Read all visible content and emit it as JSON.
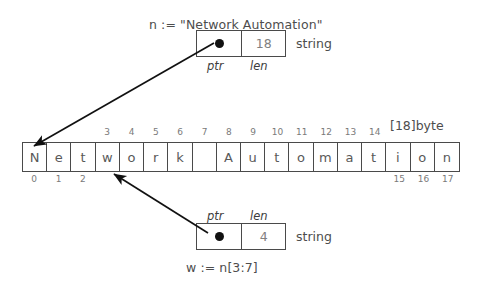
{
  "diagram": {
    "title_caption": "n := \"Network Automation\"",
    "bottom_caption": "w := n[3:7]",
    "array_type_label": "[18]byte",
    "field_ptr_label": "ptr",
    "field_len_label": "len",
    "string_type_label": "string"
  },
  "string_header_n": {
    "ptr_label": "ptr",
    "len_label": "len",
    "len_value": "18",
    "type_label": "string",
    "points_to_index": 0
  },
  "string_header_w": {
    "ptr_label": "ptr",
    "len_label": "len",
    "len_value": "4",
    "type_label": "string",
    "points_to_index": 3
  },
  "byte_array": {
    "type_label": "[18]byte",
    "length": 18,
    "cells": [
      {
        "index": "0",
        "char": "N",
        "index_side": "below"
      },
      {
        "index": "1",
        "char": "e",
        "index_side": "below"
      },
      {
        "index": "2",
        "char": "t",
        "index_side": "below"
      },
      {
        "index": "3",
        "char": "w",
        "index_side": "above"
      },
      {
        "index": "4",
        "char": "o",
        "index_side": "above"
      },
      {
        "index": "5",
        "char": "r",
        "index_side": "above"
      },
      {
        "index": "6",
        "char": "k",
        "index_side": "above"
      },
      {
        "index": "7",
        "char": " ",
        "index_side": "above"
      },
      {
        "index": "8",
        "char": "A",
        "index_side": "above"
      },
      {
        "index": "9",
        "char": "u",
        "index_side": "above"
      },
      {
        "index": "10",
        "char": "t",
        "index_side": "above"
      },
      {
        "index": "11",
        "char": "o",
        "index_side": "above"
      },
      {
        "index": "12",
        "char": "m",
        "index_side": "above"
      },
      {
        "index": "13",
        "char": "a",
        "index_side": "above"
      },
      {
        "index": "14",
        "char": "t",
        "index_side": "above"
      },
      {
        "index": "15",
        "char": "i",
        "index_side": "below"
      },
      {
        "index": "16",
        "char": "o",
        "index_side": "below"
      },
      {
        "index": "17",
        "char": "n",
        "index_side": "below"
      }
    ]
  },
  "colors": {
    "stroke": "#4a4a4a",
    "text": "#595959",
    "index_text": "#7a7a7a",
    "dot": "#111111",
    "background": "#ffffff"
  }
}
